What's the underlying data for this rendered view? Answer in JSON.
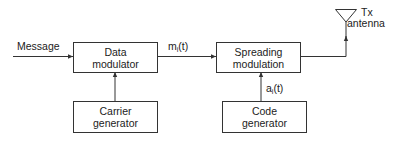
{
  "diagram": {
    "blocks": {
      "data_modulator": {
        "line1": "Data",
        "line2": "modulator"
      },
      "carrier_generator": {
        "line1": "Carrier",
        "line2": "generator"
      },
      "spreading_modulation": {
        "line1": "Spreading",
        "line2": "modulation"
      },
      "code_generator": {
        "line1": "Code",
        "line2": "generator"
      }
    },
    "signals": {
      "input": "Message",
      "mod_output_base": "m",
      "mod_output_sub": "i",
      "mod_output_arg": "(t)",
      "code_base": "a",
      "code_sub": "i",
      "code_arg": "(t)"
    },
    "antenna": {
      "line1": "Tx",
      "line2": "antenna"
    },
    "colors": {
      "stroke": "#333333",
      "text": "#222222"
    }
  }
}
